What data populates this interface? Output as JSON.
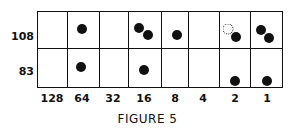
{
  "caption": "FIGURE 5",
  "rows": [
    {
      "label": "108"
    },
    {
      "label": "83"
    }
  ],
  "columns": [
    {
      "label": "128"
    },
    {
      "label": "64"
    },
    {
      "label": "32"
    },
    {
      "label": "16"
    },
    {
      "label": "8"
    },
    {
      "label": "4"
    },
    {
      "label": "2"
    },
    {
      "label": "1"
    }
  ],
  "cells": {
    "row_108": {
      "128": 0,
      "64": 1,
      "32": 0,
      "16": 2,
      "8": 1,
      "4": 0,
      "2": "1 + 1 dashed (removed)",
      "1": 2
    },
    "row_83": {
      "128": 0,
      "64": 1,
      "32": 0,
      "16": 1,
      "8": 0,
      "4": 0,
      "2": 1,
      "1": 1
    }
  }
}
